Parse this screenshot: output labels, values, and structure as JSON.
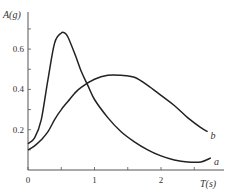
{
  "chart_data": {
    "type": "line",
    "title": "",
    "xlabel": "T(s)",
    "ylabel": "A(g)",
    "xlim": [
      0,
      2.8
    ],
    "ylim": [
      0,
      0.75
    ],
    "x_ticks": [
      0,
      0.5,
      1,
      1.5,
      2,
      2.5
    ],
    "x_tick_labels": [
      "0",
      "",
      "1",
      "",
      "2",
      ""
    ],
    "y_ticks": [
      0.1,
      0.2,
      0.3,
      0.4,
      0.5,
      0.6,
      0.7
    ],
    "y_tick_labels": [
      "",
      "0.2",
      "",
      "0.4",
      "",
      "0.6",
      ""
    ],
    "grid": false,
    "legend": "inline labels at curve ends",
    "series": [
      {
        "name": "a",
        "x": [
          0,
          0.1,
          0.2,
          0.3,
          0.4,
          0.5,
          0.55,
          0.6,
          0.7,
          0.8,
          0.9,
          1.0,
          1.2,
          1.4,
          1.6,
          1.8,
          2.0,
          2.2,
          2.4,
          2.6,
          2.75
        ],
        "values": [
          0.13,
          0.16,
          0.25,
          0.45,
          0.63,
          0.68,
          0.68,
          0.66,
          0.58,
          0.49,
          0.42,
          0.35,
          0.26,
          0.19,
          0.14,
          0.1,
          0.07,
          0.05,
          0.04,
          0.04,
          0.06
        ]
      },
      {
        "name": "b",
        "x": [
          0,
          0.1,
          0.2,
          0.3,
          0.4,
          0.5,
          0.6,
          0.7,
          0.8,
          1.0,
          1.2,
          1.4,
          1.6,
          1.8,
          2.0,
          2.2,
          2.4,
          2.6,
          2.7
        ],
        "values": [
          0.1,
          0.12,
          0.15,
          0.19,
          0.25,
          0.3,
          0.34,
          0.38,
          0.41,
          0.45,
          0.47,
          0.47,
          0.46,
          0.42,
          0.37,
          0.32,
          0.26,
          0.21,
          0.19
        ]
      }
    ]
  },
  "labels": {
    "y_axis_title": "A(g)",
    "x_axis_title": "T(s)",
    "series_a": "a",
    "series_b": "b"
  }
}
